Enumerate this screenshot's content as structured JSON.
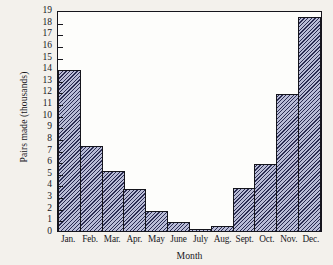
{
  "chart_data": {
    "type": "bar",
    "title": "",
    "xlabel": "Month",
    "ylabel": "Pairs made (thousands)",
    "categories": [
      "Jan.",
      "Feb.",
      "Mar.",
      "Apr.",
      "May",
      "June",
      "July",
      "Aug.",
      "Sept.",
      "Oct.",
      "Nov.",
      "Dec."
    ],
    "values": [
      13.8,
      7.3,
      5.2,
      3.6,
      1.75,
      0.75,
      0.2,
      0.4,
      3.7,
      5.8,
      11.8,
      18.4
    ],
    "ylim": [
      0,
      19
    ],
    "xlim_categorical": true,
    "ytick_labels": [
      "0",
      "1",
      "2",
      "3",
      "4",
      "5",
      "6",
      "7",
      "8",
      "9",
      "10",
      "11",
      "12",
      "13",
      "14",
      "15",
      "16",
      "17",
      "18",
      "19"
    ],
    "ytick_values": [
      0,
      1,
      2,
      3,
      4,
      5,
      6,
      7,
      8,
      9,
      10,
      11,
      12,
      13,
      14,
      15,
      16,
      17,
      18,
      19
    ],
    "grid": false,
    "legend": null,
    "bar_gap": 0,
    "colors": {
      "bar_fill": "#b9bcd6",
      "bar_hatch": "#2a2c52",
      "bar_edge": "#15151c",
      "plot_background": "#fdfdfb",
      "page_background": "#f3f1ec",
      "text": "#17171c"
    }
  }
}
